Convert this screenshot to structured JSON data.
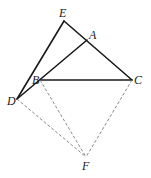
{
  "diagram": {
    "points": {
      "E": {
        "x": 64,
        "y": 21,
        "label": "E"
      },
      "A": {
        "x": 87,
        "y": 40,
        "label": "A"
      },
      "B": {
        "x": 40,
        "y": 80,
        "label": "B"
      },
      "C": {
        "x": 132,
        "y": 80,
        "label": "C"
      },
      "D": {
        "x": 17,
        "y": 99,
        "label": "D"
      },
      "F": {
        "x": 86,
        "y": 157,
        "label": "F"
      }
    },
    "solid_segments": [
      "E-D",
      "E-C",
      "D-A",
      "B-C"
    ],
    "dashed_segments": [
      "D-F",
      "B-F",
      "C-F"
    ],
    "labels": {
      "E": "E",
      "A": "A",
      "B": "B",
      "C": "C",
      "D": "D",
      "F": "F"
    }
  }
}
